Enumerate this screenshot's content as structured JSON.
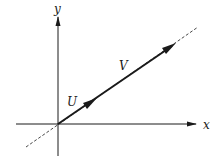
{
  "figure": {
    "axes": {
      "x_label": "x",
      "y_label": "y"
    },
    "vectors": [
      {
        "name": "U"
      },
      {
        "name": "V"
      }
    ],
    "colors": {
      "ink": "#1a1a1a",
      "background": "#ffffff"
    }
  }
}
